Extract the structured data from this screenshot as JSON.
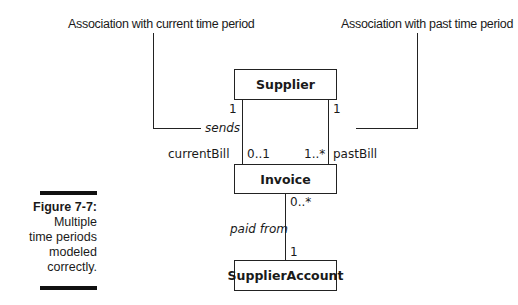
{
  "callouts": {
    "current": "Association with current time period",
    "past": "Association with past time period"
  },
  "classes": {
    "supplier": "Supplier",
    "invoice": "Invoice",
    "supplier_account": "SupplierAccount"
  },
  "associations": {
    "current": {
      "name": "sends",
      "supplier_multiplicity": "1",
      "invoice_multiplicity": "0..1",
      "role": "currentBill"
    },
    "past": {
      "supplier_multiplicity": "1",
      "invoice_multiplicity": "1..*",
      "role": "pastBill"
    },
    "payment": {
      "name": "paid from",
      "invoice_multiplicity": "0..*",
      "account_multiplicity": "1"
    }
  },
  "caption": {
    "title": "Figure 7-7:",
    "lines": [
      "Multiple",
      "time periods",
      "modeled",
      "correctly."
    ]
  }
}
